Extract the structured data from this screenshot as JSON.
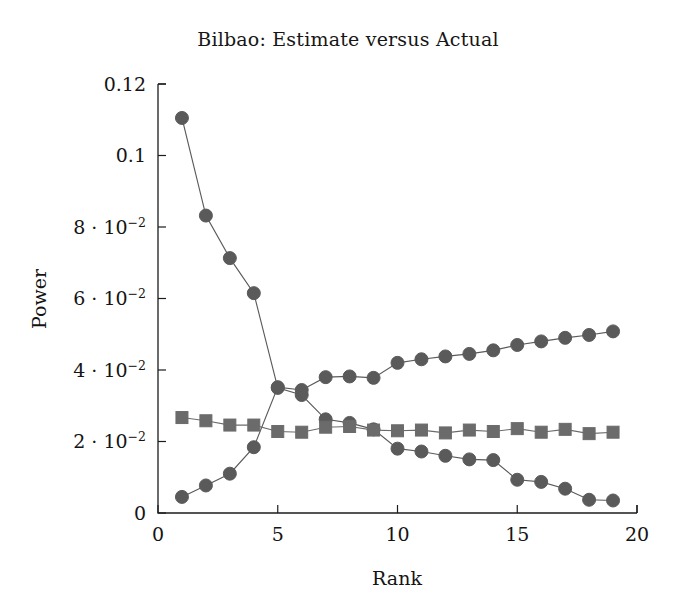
{
  "chart_data": {
    "type": "line",
    "title": "Bilbao: Estimate versus Actual",
    "xlabel": "Rank",
    "ylabel": "Power",
    "xlim": [
      0,
      20
    ],
    "ylim": [
      0,
      0.12
    ],
    "grid": false,
    "legend": "none",
    "x_ticks": [
      "0",
      "5",
      "10",
      "15",
      "20"
    ],
    "x_tick_values": [
      0,
      5,
      10,
      15,
      20
    ],
    "y_ticks": [
      "0",
      "2 · 10⁻²",
      "4 · 10⁻²",
      "6 · 10⁻²",
      "8 · 10⁻²",
      "0.1",
      "0.12"
    ],
    "y_tick_values": [
      0,
      0.02,
      0.04,
      0.06,
      0.08,
      0.1,
      0.12
    ],
    "x": [
      1,
      2,
      3,
      4,
      5,
      6,
      7,
      8,
      9,
      10,
      11,
      12,
      13,
      14,
      15,
      16,
      17,
      18,
      19
    ],
    "series": [
      {
        "name": "actual-descending",
        "marker": "circle",
        "color": "#5a5a5a",
        "values": [
          0.1105,
          0.0832,
          0.0713,
          0.0615,
          0.035,
          0.033,
          0.0262,
          0.0252,
          0.0234,
          0.018,
          0.0172,
          0.016,
          0.015,
          0.0148,
          0.0093,
          0.0087,
          0.0068,
          0.0037,
          0.0035
        ]
      },
      {
        "name": "estimate-ascending",
        "marker": "circle",
        "color": "#5a5a5a",
        "values": [
          0.0045,
          0.0077,
          0.011,
          0.0184,
          0.0352,
          0.0344,
          0.038,
          0.0382,
          0.0378,
          0.042,
          0.043,
          0.0438,
          0.0445,
          0.0455,
          0.047,
          0.048,
          0.049,
          0.0498,
          0.0508
        ]
      },
      {
        "name": "estimate-flat-squares",
        "marker": "square",
        "color": "#6b6b6b",
        "values": [
          0.0267,
          0.0258,
          0.0246,
          0.0246,
          0.0228,
          0.0226,
          0.024,
          0.0242,
          0.0232,
          0.023,
          0.0232,
          0.0224,
          0.0232,
          0.0228,
          0.0236,
          0.0226,
          0.0234,
          0.0222,
          0.0226
        ]
      }
    ]
  },
  "axes": {
    "x_axis_name": "Rank",
    "y_axis_name": "Power"
  }
}
